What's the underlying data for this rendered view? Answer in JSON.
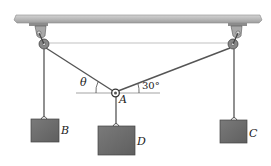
{
  "figure": {
    "type": "statics-pulley-diagram",
    "labels": {
      "theta": "θ",
      "angle": "30°",
      "ring": "A",
      "block_left": "B",
      "block_center": "D",
      "block_right": "C"
    },
    "colors": {
      "ceiling": "#b9b9b9",
      "block": "#6f6f6f",
      "rope": "#555555",
      "line": "#333333"
    }
  }
}
